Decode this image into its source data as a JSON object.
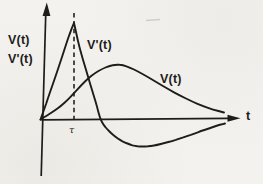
{
  "figure": {
    "kind": "hand-drawn graph sketch (scanned)",
    "paper_color": "#f3f2ee",
    "ink_color": "#1d1d1b",
    "labels": {
      "y_axis_line1": "V(t)",
      "y_axis_line2": "V'(t)",
      "x_axis": "t",
      "tau_tick": "τ",
      "vprime_curve": "V'(t)",
      "v_curve": "V(t)"
    }
  },
  "chart_data": {
    "type": "line",
    "title": "",
    "xlabel": "t",
    "ylabel": "V(t), V'(t)",
    "grid": false,
    "legend": "inline labels next to each curve",
    "units": "arbitrary units — qualitative sketch, no numeric scale shown",
    "axis_ranges": {
      "t": [
        0,
        200
      ],
      "v": [
        -35,
        110
      ]
    },
    "tick_labels_x": [
      {
        "t": 33.5,
        "label": "τ"
      }
    ],
    "annotations": [
      {
        "type": "dashed_vertical_line",
        "t": 33.5,
        "v_top": 106.5,
        "meaning": "marks the sharp peak of V'(t)"
      }
    ],
    "series": [
      {
        "name": "V'(t)",
        "shape": "rises steeply from origin to sharp peak, falls through zero, dips to a shallow negative minimum, returns asymptotically to axis",
        "points": [
          [
            0,
            0
          ],
          [
            4,
            11
          ],
          [
            7.5,
            21.5
          ],
          [
            11.5,
            33
          ],
          [
            15.5,
            44.5
          ],
          [
            19.5,
            56.5
          ],
          [
            23.5,
            68.5
          ],
          [
            26.5,
            78
          ],
          [
            29.5,
            86.5
          ],
          [
            31.5,
            92
          ],
          [
            33.5,
            96.5
          ],
          [
            33.5,
            96.5
          ],
          [
            36,
            85
          ],
          [
            39,
            72
          ],
          [
            42.5,
            59.5
          ],
          [
            46,
            48
          ],
          [
            49.5,
            36
          ],
          [
            53,
            24.5
          ],
          [
            56.5,
            13
          ],
          [
            59.5,
            1
          ],
          [
            63,
            -5.5
          ],
          [
            66.5,
            -9.5
          ],
          [
            70.5,
            -13.5
          ],
          [
            74.5,
            -17
          ],
          [
            79.5,
            -20.5
          ],
          [
            84.5,
            -23
          ],
          [
            89.5,
            -25
          ],
          [
            94.5,
            -26.5
          ],
          [
            99.5,
            -27
          ],
          [
            104.5,
            -27
          ],
          [
            110.5,
            -26.5
          ],
          [
            116.5,
            -25.5
          ],
          [
            124,
            -23.5
          ],
          [
            131.5,
            -21.5
          ],
          [
            139,
            -19
          ],
          [
            146.5,
            -16.5
          ],
          [
            154,
            -14
          ],
          [
            160.5,
            -11.5
          ],
          [
            167,
            -9.5
          ],
          [
            172.5,
            -7.5
          ],
          [
            178.5,
            -5.5
          ],
          [
            184.5,
            -4
          ]
        ]
      },
      {
        "name": "V(t)",
        "shape": "slow S-shaped rise from origin to broad rounded maximum, then gradual decay back toward axis",
        "points": [
          [
            0,
            0
          ],
          [
            6.5,
            4
          ],
          [
            13.5,
            8.5
          ],
          [
            20.5,
            13.5
          ],
          [
            27.5,
            20
          ],
          [
            33.5,
            26.5
          ],
          [
            40.5,
            34
          ],
          [
            47.5,
            41
          ],
          [
            54.5,
            46.5
          ],
          [
            61.5,
            50.5
          ],
          [
            68.5,
            53.5
          ],
          [
            75.5,
            55
          ],
          [
            82.5,
            54.5
          ],
          [
            89.5,
            52
          ],
          [
            97.5,
            48
          ],
          [
            106.5,
            43
          ],
          [
            116.5,
            37
          ],
          [
            127.5,
            30.5
          ],
          [
            139.5,
            24
          ],
          [
            151.5,
            18
          ],
          [
            162.5,
            13.5
          ],
          [
            172.5,
            10
          ],
          [
            183.5,
            7
          ]
        ]
      }
    ]
  }
}
